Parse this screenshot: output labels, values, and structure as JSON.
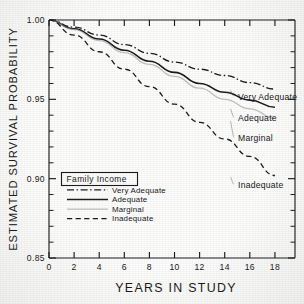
{
  "chart_data": {
    "type": "line",
    "title": "",
    "xlabel": "YEARS IN STUDY",
    "ylabel": "ESTIMATED SURVIVAL PROBABILITY",
    "xlim": [
      0,
      19.6
    ],
    "ylim": [
      0.85,
      1.0
    ],
    "xticks": [
      0,
      2,
      4,
      6,
      8,
      10,
      12,
      14,
      16,
      18
    ],
    "xticklabels": [
      "0",
      "2",
      "4",
      "6",
      "8",
      "10",
      "12",
      "14",
      "16",
      "18"
    ],
    "yticks": [
      0.85,
      0.9,
      0.95,
      1.0
    ],
    "yticklabels": [
      "0.85",
      "0.90",
      "0.95",
      "1.00"
    ],
    "yminorticks": [
      0.86,
      0.87,
      0.88,
      0.89,
      0.91,
      0.92,
      0.93,
      0.94,
      0.96,
      0.97,
      0.98,
      0.99
    ],
    "grid": false,
    "legend_position": "lower-left-inside",
    "legend_title": "Family Income",
    "x": [
      0,
      2,
      4,
      6,
      8,
      10,
      12,
      14,
      16,
      18
    ],
    "series": [
      {
        "name": "Very Adequate",
        "style": "dash-dot",
        "color": "#1b1c1e",
        "end_label": "Very Adequate",
        "values": [
          1.0,
          0.9955,
          0.9905,
          0.9845,
          0.979,
          0.9735,
          0.969,
          0.965,
          0.9605,
          0.9565
        ]
      },
      {
        "name": "Adequate",
        "style": "solid",
        "color": "#1b1c1e",
        "end_label": "Adequate",
        "values": [
          1.0,
          0.9945,
          0.988,
          0.981,
          0.974,
          0.967,
          0.96,
          0.9545,
          0.9495,
          0.945
        ]
      },
      {
        "name": "Marginal",
        "style": "solid-light",
        "color": "#9a9b9d",
        "end_label": "Marginal",
        "values": [
          1.0,
          0.994,
          0.987,
          0.9795,
          0.972,
          0.9645,
          0.957,
          0.95,
          0.944,
          0.938
        ]
      },
      {
        "name": "Inadequate",
        "style": "dashed",
        "color": "#1b1c1e",
        "end_label": "Inadequate",
        "values": [
          1.0,
          0.9905,
          0.98,
          0.969,
          0.958,
          0.947,
          0.9355,
          0.925,
          0.914,
          0.902
        ]
      }
    ],
    "legend_entries": [
      {
        "label": "Very Adequate",
        "style": "dash-dot"
      },
      {
        "label": "Adequate",
        "style": "solid"
      },
      {
        "label": "Marginal",
        "style": "solid-light"
      },
      {
        "label": "Inadequate",
        "style": "dashed"
      }
    ]
  }
}
